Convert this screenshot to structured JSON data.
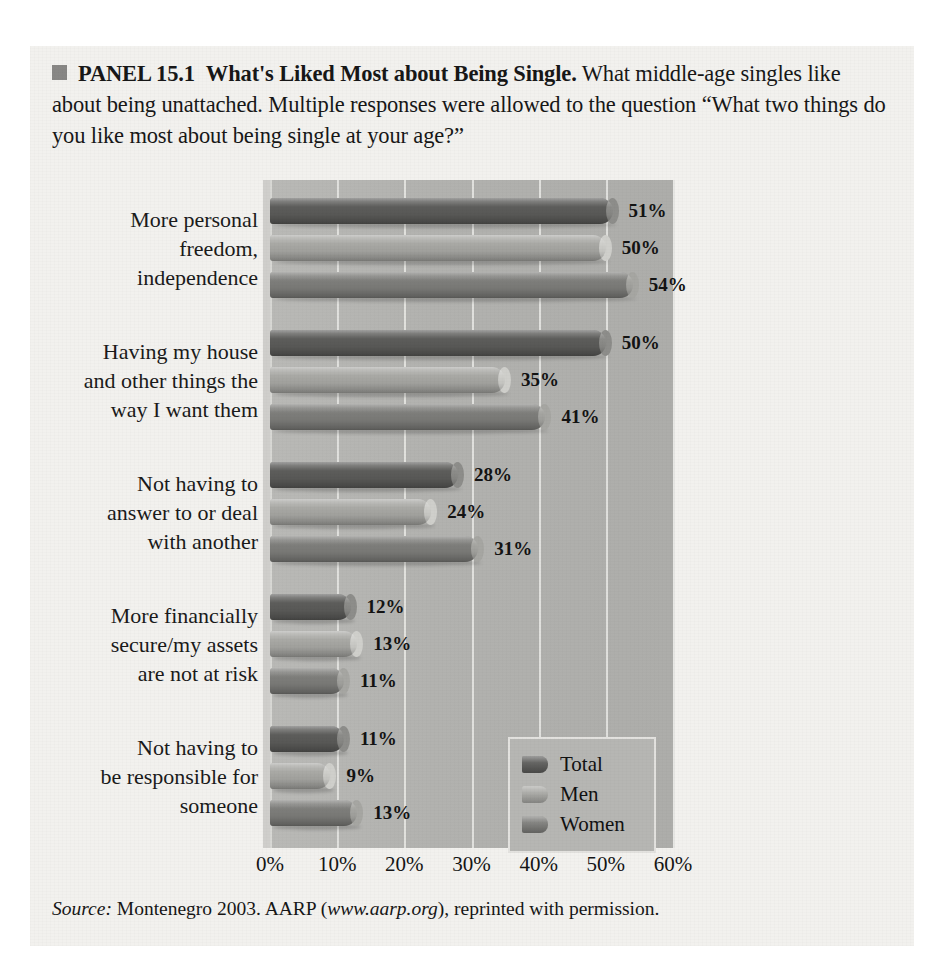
{
  "panel": {
    "bullet_icon": "square-bullet-icon",
    "label": "PANEL 15.1",
    "title": "What's Liked Most about Being Single.",
    "description": "What middle-age singles like about being unattached. Multiple responses were allowed to the question “What two things do you like most about being single at your age?”",
    "source_prefix": "Source:",
    "source_text": " Montenegro 2003. AARP (",
    "source_url": "www.aarp.org",
    "source_suffix": "), reprinted with permission."
  },
  "colors": {
    "total": "#5d5d5b",
    "men": "#a9a9a5",
    "women": "#7e7e7b",
    "plot_background": "#b4b4b1",
    "panel_background": "#f2f1ee",
    "gridline": "#e6e5e2"
  },
  "legend": {
    "position": "inside-lower-right",
    "items": [
      {
        "name": "Total",
        "color_key": "total"
      },
      {
        "name": "Men",
        "color_key": "men"
      },
      {
        "name": "Women",
        "color_key": "women"
      }
    ]
  },
  "chart_data": {
    "type": "bar",
    "orientation": "horizontal",
    "title": "What's Liked Most about Being Single.",
    "xlabel": "",
    "ylabel": "",
    "xlim": [
      0,
      60
    ],
    "grid": true,
    "legend_position": "inside-lower-right",
    "xticks": [
      0,
      10,
      20,
      30,
      40,
      50,
      60
    ],
    "xtick_labels": [
      "0%",
      "10%",
      "20%",
      "30%",
      "40%",
      "50%",
      "60%"
    ],
    "value_suffix": "%",
    "categories": [
      "More personal freedom, independence",
      "Having my house and other things the way I want them",
      "Not having to answer to or deal with another",
      "More financially secure/my assets are not at risk",
      "Not having to be responsible for someone"
    ],
    "category_lines": [
      [
        "More personal",
        "freedom,",
        "independence"
      ],
      [
        "Having my house",
        "and other things the",
        "way I want them"
      ],
      [
        "Not having to",
        "answer to or deal",
        "with another"
      ],
      [
        "More financially",
        "secure/my assets",
        "are not at risk"
      ],
      [
        "Not having to",
        "be responsible for",
        "someone"
      ]
    ],
    "series": [
      {
        "name": "Total",
        "values": [
          51,
          50,
          28,
          12,
          11
        ],
        "labels": [
          "51%",
          "50%",
          "28%",
          "12%",
          "11%"
        ]
      },
      {
        "name": "Men",
        "values": [
          50,
          35,
          24,
          13,
          9
        ],
        "labels": [
          "50%",
          "35%",
          "24%",
          "13%",
          "9%"
        ]
      },
      {
        "name": "Women",
        "values": [
          54,
          41,
          31,
          11,
          13
        ],
        "labels": [
          "54%",
          "41%",
          "31%",
          "11%",
          "13%"
        ]
      }
    ]
  }
}
